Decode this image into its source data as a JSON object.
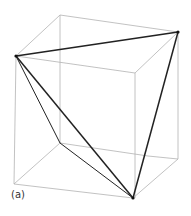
{
  "figure": {
    "label": "(a)",
    "colors": {
      "cube_edges": "#b0b0b0",
      "tetra_edges": "#222222",
      "background": "#ffffff"
    }
  }
}
